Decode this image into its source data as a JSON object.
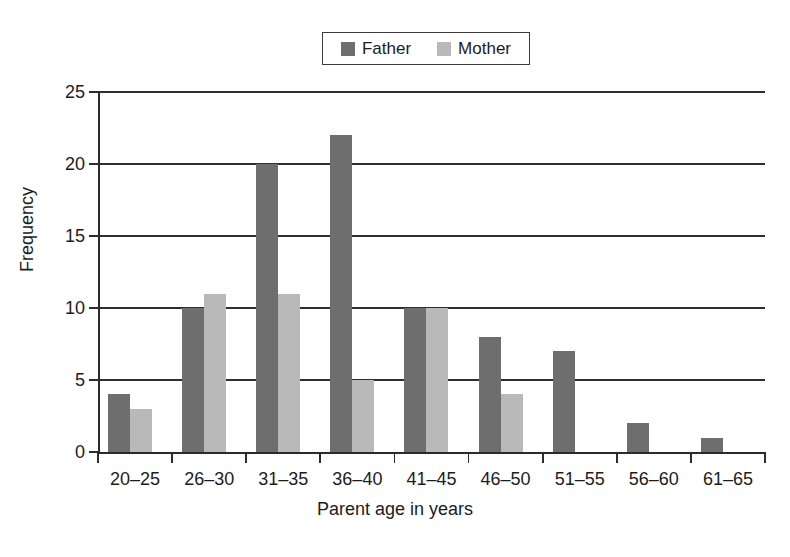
{
  "chart_data": {
    "type": "bar",
    "title": "",
    "subtitle": "",
    "xlabel": "Parent age in years",
    "ylabel": "Frequency",
    "categories": [
      "20–25",
      "26–30",
      "31–35",
      "36–40",
      "41–45",
      "46–50",
      "51–55",
      "56–60",
      "61–65"
    ],
    "series": [
      {
        "name": "Father",
        "color": "#6e6e6e",
        "values": [
          4,
          10,
          20,
          22,
          10,
          8,
          7,
          2,
          1
        ]
      },
      {
        "name": "Mother",
        "color": "#b9b9b9",
        "values": [
          3,
          11,
          11,
          5,
          10,
          4,
          0,
          0,
          0
        ]
      }
    ],
    "ylim": [
      0,
      25
    ],
    "ytick_values": [
      0,
      5,
      10,
      15,
      20,
      25
    ],
    "ytick_labels": [
      "0",
      "5",
      "10",
      "15",
      "20",
      "25"
    ],
    "grid": "horizontal",
    "legend_position": "top-center",
    "bar_style": "grouped"
  },
  "legend": {
    "entries": [
      {
        "label": "Father",
        "swatch": "legend-swatch-father"
      },
      {
        "label": "Mother",
        "swatch": "legend-swatch-mother"
      }
    ]
  },
  "colors": {
    "father": "#6e6e6e",
    "mother": "#b9b9b9",
    "axis": "#2b2b2b",
    "grid": "#2f2f2f",
    "text": "#1c1c1c",
    "background": "#ffffff"
  }
}
